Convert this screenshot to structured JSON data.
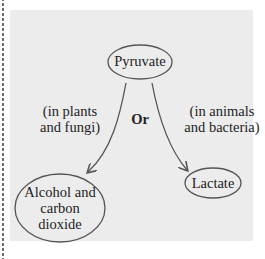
{
  "diagram": {
    "nodes": {
      "pyruvate": "Pyruvate",
      "alcohol_line1": "Alcohol and",
      "alcohol_line2": "carbon",
      "alcohol_line3": "dioxide",
      "lactate": "Lactate"
    },
    "labels": {
      "left_line1": "(in plants",
      "left_line2": "and fungi)",
      "right_line1": "(in animals",
      "right_line2": "and bacteria)",
      "or": "Or"
    },
    "colors": {
      "background": "#ececec",
      "stroke": "#555555",
      "text": "#222222"
    }
  }
}
